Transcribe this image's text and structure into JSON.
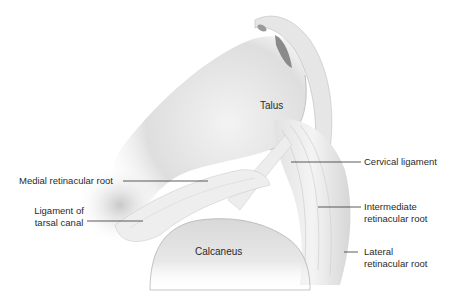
{
  "figure": {
    "structures": {
      "talus": "Talus",
      "calcaneus": "Calcaneus"
    },
    "labels": {
      "medial_retinacular_root": "Medial retinacular root",
      "ligament_tarsal_canal_line1": "Ligament of",
      "ligament_tarsal_canal_line2": "tarsal canal",
      "cervical_ligament": "Cervical ligament",
      "intermediate_root_line1": "Intermediate",
      "intermediate_root_line2": "retinacular root",
      "lateral_root_line1": "Lateral",
      "lateral_root_line2": "retinacular root"
    },
    "colors": {
      "text": "#2a2a2a",
      "leader_line": "#333333",
      "bone_shade": "#c8c8c8",
      "ligament_light": "#ececec",
      "tendon_dark": "#8a8a8a"
    }
  }
}
